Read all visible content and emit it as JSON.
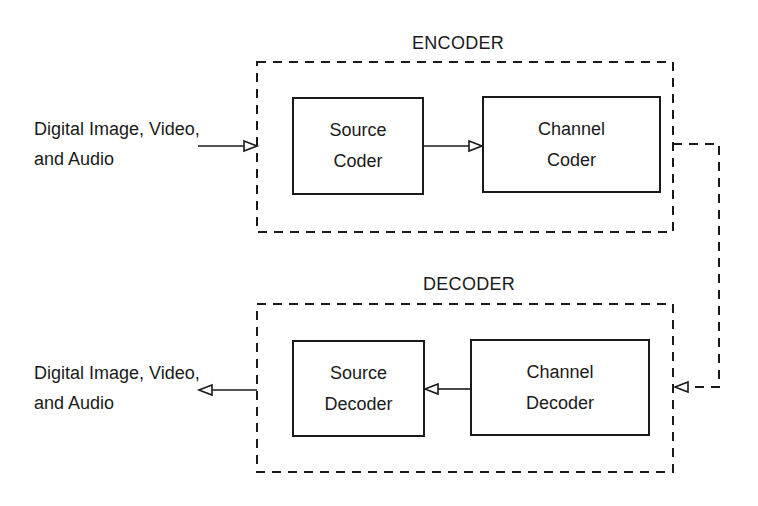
{
  "encoder": {
    "title": "ENCODER",
    "input_label": [
      "Digital Image, Video,",
      "and Audio"
    ],
    "blocks": [
      {
        "lines": [
          "Source",
          "Coder"
        ]
      },
      {
        "lines": [
          "Channel",
          "Coder"
        ]
      }
    ]
  },
  "decoder": {
    "title": "DECODER",
    "output_label": [
      "Digital Image, Video,",
      "and Audio"
    ],
    "blocks": [
      {
        "lines": [
          "Source",
          "Decoder"
        ]
      },
      {
        "lines": [
          "Channel",
          "Decoder"
        ]
      }
    ]
  },
  "colors": {
    "stroke": "#1a1a1a",
    "background": "#ffffff"
  }
}
